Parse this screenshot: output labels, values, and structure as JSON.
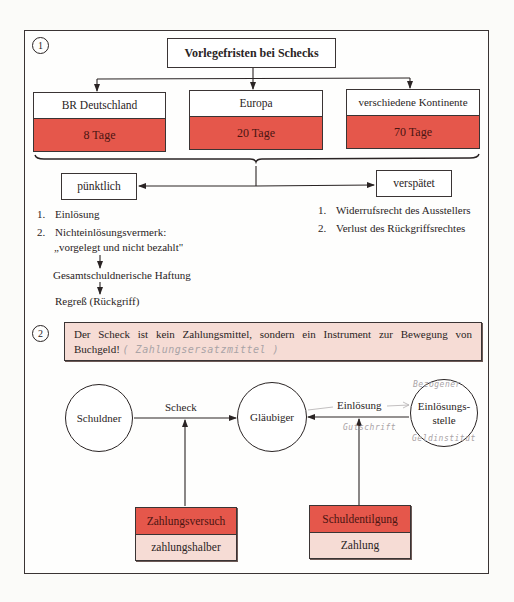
{
  "section1": {
    "number": "1",
    "title": "Vorlegefristen bei Schecks",
    "periods": [
      {
        "region": "BR Deutschland",
        "days": "8 Tage"
      },
      {
        "region": "Europa",
        "days": "20 Tage"
      },
      {
        "region": "verschiedene Kontinente",
        "days": "70 Tage"
      }
    ],
    "timing": {
      "on_time": {
        "label": "pünktlich",
        "items": [
          {
            "n": "1.",
            "text": "Einlösung"
          },
          {
            "n": "2.",
            "text": "Nichteinlösungsvermerk:",
            "sub": "„vorgelegt und nicht bezahlt\""
          }
        ],
        "chain": [
          "Gesamtschuldnerische Haftung",
          "Regreß (Rückgriff)"
        ]
      },
      "late": {
        "label": "verspätet",
        "items": [
          {
            "n": "1.",
            "text": "Widerrufsrecht des Ausstellers"
          },
          {
            "n": "2.",
            "text": "Verlust des Rückgriffsrechtes"
          }
        ]
      }
    }
  },
  "section2": {
    "number": "2",
    "statement_line1": "Der Scheck ist kein Zahlungsmittel, sondern ein Instrument zur Bewegung von",
    "statement_line2": "Buchgeld!",
    "handwritten_note": "( Zahlungsersatzmittel )",
    "parties": {
      "debtor": "Schuldner",
      "creditor": "Gläubiger",
      "redemption_line1": "Einlösungs-",
      "redemption_line2": "stelle"
    },
    "flows": {
      "check": "Scheck",
      "redemption": "Einlösung"
    },
    "handwritten": {
      "above_redemption": "Bezogener",
      "below_redemption": "Geldinstitut",
      "below_arrow": "Gutschrift"
    },
    "roles": [
      {
        "title": "Zahlungsversuch",
        "sub": "zahlungshalber"
      },
      {
        "title": "Schuldentilgung",
        "sub": "Zahlung"
      }
    ]
  },
  "colors": {
    "red": "#e5574b",
    "pink": "#f6dcd5",
    "line": "#2a2424",
    "pencil": "#a9a3a6"
  }
}
